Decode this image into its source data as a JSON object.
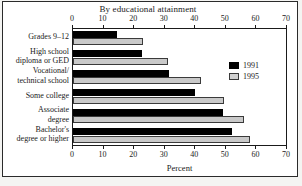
{
  "chart_data": {
    "type": "bar",
    "orientation": "horizontal",
    "title": "By educational attainment",
    "xlabel": "Percent",
    "ylabel": "",
    "xlim": [
      0,
      70
    ],
    "xticks": [
      0,
      10,
      20,
      30,
      40,
      50,
      60,
      70
    ],
    "xticklabels": [
      "0",
      "10",
      "20",
      "30",
      "40",
      "50",
      "60",
      "70"
    ],
    "grid": false,
    "legend_position": "right",
    "axis_top": true,
    "axis_bottom": true,
    "categories": [
      "Grades 9–12",
      "High school diploma or GED",
      "Vocational/ technical school",
      "Some college",
      "Associate degree",
      "Bachelor's degree or higher"
    ],
    "category_lines": [
      [
        "Grades 9–12"
      ],
      [
        "High school",
        "diploma or GED"
      ],
      [
        "Vocational/",
        "technical school"
      ],
      [
        "Some college"
      ],
      [
        "Associate",
        "degree"
      ],
      [
        "Bachelor's",
        "degree or higher"
      ]
    ],
    "series": [
      {
        "name": "1991",
        "color": "#000000",
        "values": [
          14.5,
          22.5,
          31.5,
          40.0,
          49.0,
          52.0
        ]
      },
      {
        "name": "1995",
        "color": "#c9c9c9",
        "values": [
          23.0,
          31.0,
          42.0,
          49.5,
          56.0,
          58.0
        ]
      }
    ]
  },
  "legend": {
    "entries": [
      {
        "label": "1991"
      },
      {
        "label": "1995"
      }
    ]
  },
  "colors": {
    "series_1991": "#000000",
    "series_1995": "#c9c9c9",
    "axis": "#1a1a1a",
    "frame": "#2b2b2b",
    "background": "#ffffff",
    "page_background": "#f4f4f2"
  }
}
